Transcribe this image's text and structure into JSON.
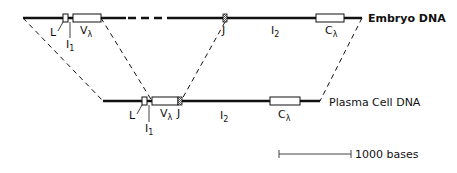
{
  "diagram": {
    "embryo": {
      "label": "Embryo DNA",
      "segments": {
        "L": "L",
        "I1_main": "I",
        "I1_sub": "1",
        "V_main": "V",
        "V_sub": "λ",
        "J": "J",
        "I2_main": "I",
        "I2_sub": "2",
        "C_main": "C",
        "C_sub": "λ"
      }
    },
    "plasma": {
      "label": "Plasma Cell DNA",
      "segments": {
        "L": "L",
        "I1_main": "I",
        "I1_sub": "1",
        "V_main": "V",
        "V_sub": "λ",
        "J": "J",
        "I2_main": "I",
        "I2_sub": "2",
        "C_main": "C",
        "C_sub": "λ"
      }
    },
    "scale_bar": {
      "label": "1000 bases"
    },
    "colors": {
      "line": "#111111",
      "background": "#ffffff",
      "j_hatch": "#888888"
    }
  }
}
